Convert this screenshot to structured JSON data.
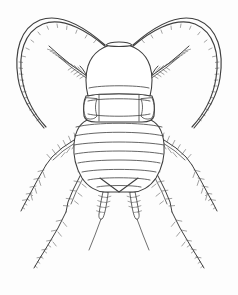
{
  "figure": {
    "common_name": "cockroach nymph",
    "view": "dorsal",
    "style": "black and white line drawing",
    "caption": "",
    "background_color": "#fdfdfd",
    "line_color": "#3f3f3f",
    "detail_line_color": "#4a4a4a",
    "bristle_color": "#555555",
    "fill_color": "#ffffff",
    "canvas": {
      "width": 238,
      "height": 295
    }
  },
  "anatomy": {
    "head": {
      "label": "head",
      "shape": "oval",
      "center_x": 119,
      "center_y": 72,
      "width": 58,
      "height": 52
    },
    "vertex_plate": {
      "label": "vertex plate",
      "description": "small trapezoid at top of head where antennae insert"
    },
    "pronotum": {
      "label": "pronotum",
      "segment_count": 1,
      "has_lateral_lobes": true
    },
    "tegmina": {
      "label": "wing pads",
      "segment_count": 2
    },
    "abdomen": {
      "label": "abdomen",
      "shape": "tapering oval ending in point",
      "segment_count": 8,
      "tip_x": 119,
      "tip_y": 190
    },
    "cerci": {
      "label": "cerci",
      "count": 2,
      "segments_each": 6,
      "description": "segmented bristly appendages at abdomen tip"
    },
    "antennae": {
      "label": "antennae",
      "count": 2,
      "description": "long curved filaments sweeping up and outward, finely segmented",
      "left_tip": {
        "x": 44,
        "y": 128
      },
      "right_tip": {
        "x": 194,
        "y": 128
      }
    },
    "legs": {
      "label": "legs",
      "pairs": 3,
      "items": [
        {
          "name": "front-leg",
          "pair": "prothoracic",
          "direction": "forward-outward",
          "bristly": true
        },
        {
          "name": "middle-leg",
          "pair": "mesothoracic",
          "direction": "outward-downward",
          "bristly": true
        },
        {
          "name": "hind-leg",
          "pair": "metathoracic",
          "direction": "downward-outward",
          "bristly": true
        }
      ]
    }
  }
}
